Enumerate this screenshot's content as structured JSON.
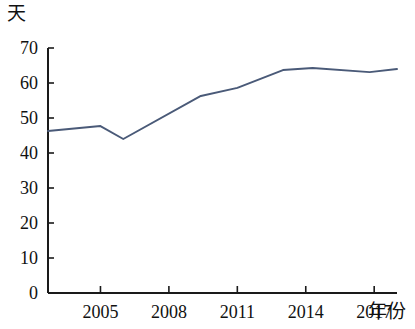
{
  "chart_data": {
    "type": "line",
    "title": "",
    "subtitle": "",
    "xlabel": "年份",
    "ylabel": "天",
    "xlim": [
      2002.7,
      2018.0
    ],
    "ylim": [
      0,
      70
    ],
    "grid": false,
    "legend": null,
    "x_ticks": [
      2005,
      2008,
      2011,
      2014,
      2017
    ],
    "x_tick_labels": [
      "2005",
      "2008",
      "2011",
      "2014",
      "2017"
    ],
    "y_ticks": [
      0,
      10,
      20,
      30,
      40,
      50,
      60,
      70
    ],
    "y_tick_labels": [
      "0",
      "10",
      "20",
      "30",
      "40",
      "50",
      "60",
      "70"
    ],
    "line_color": "#4a5a78",
    "series": [
      {
        "name": "天数",
        "x": [
          2002.7,
          2005.0,
          2006.0,
          2009.4,
          2011.0,
          2013.0,
          2014.3,
          2016.8,
          2018.0
        ],
        "values": [
          46.3,
          47.7,
          44.0,
          56.3,
          58.6,
          63.7,
          64.3,
          63.1,
          64.0
        ]
      }
    ]
  },
  "axes": {
    "y_unit": "天",
    "x_unit": "年份"
  }
}
